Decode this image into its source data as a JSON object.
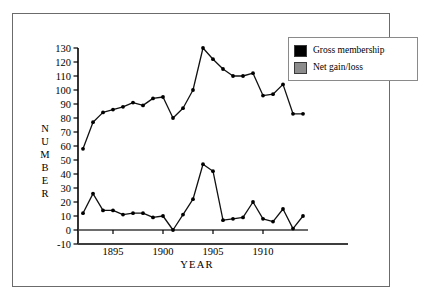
{
  "legend": {
    "position": "top-right",
    "entries": [
      {
        "label": "Gross membership",
        "color": "#000000",
        "name": "gross-membership"
      },
      {
        "label": "Net gain/loss",
        "color": "#8c8c8c",
        "name": "net-gain-loss"
      }
    ]
  },
  "axes": {
    "ylabel_letters": [
      "N",
      "U",
      "M",
      "B",
      "E",
      "R"
    ],
    "ylabel": "NUMBER",
    "xlabel": "YEAR",
    "yticks": [
      130,
      120,
      110,
      100,
      90,
      80,
      70,
      60,
      50,
      40,
      30,
      20,
      10,
      0,
      -10
    ],
    "ylim": [
      -10,
      130
    ],
    "xticks": [
      1895,
      1900,
      1905,
      1910
    ],
    "xlim": [
      1891.5,
      1914.5
    ],
    "grid": false,
    "zero_line": true
  },
  "chart_data": {
    "type": "line",
    "title": "",
    "subtitle": "",
    "xlabel": "YEAR",
    "ylabel": "NUMBER",
    "ylim": [
      -10,
      130
    ],
    "xlim": [
      1891.5,
      1914.5
    ],
    "yticks": [
      130,
      120,
      110,
      100,
      90,
      80,
      70,
      60,
      50,
      40,
      30,
      20,
      10,
      0,
      -10
    ],
    "xticks": [
      1895,
      1900,
      1905,
      1910
    ],
    "grid": false,
    "legend_position": "top-right",
    "x": [
      1892,
      1893,
      1894,
      1895,
      1896,
      1897,
      1898,
      1899,
      1900,
      1901,
      1902,
      1903,
      1904,
      1905,
      1906,
      1907,
      1908,
      1909,
      1910,
      1911,
      1912,
      1913,
      1914
    ],
    "series": [
      {
        "name": "Gross membership",
        "color": "#000000",
        "values": [
          58,
          77,
          84,
          86,
          88,
          91,
          89,
          94,
          95,
          80,
          87,
          100,
          130,
          122,
          115,
          110,
          110,
          112,
          96,
          97,
          104,
          83,
          83
        ]
      },
      {
        "name": "Net gain/loss",
        "color": "#8c8c8c",
        "values": [
          12,
          26,
          14,
          14,
          11,
          12,
          12,
          9,
          10,
          0,
          11,
          22,
          47,
          42,
          7,
          8,
          9,
          20,
          8,
          6,
          15,
          1,
          10
        ]
      }
    ]
  }
}
